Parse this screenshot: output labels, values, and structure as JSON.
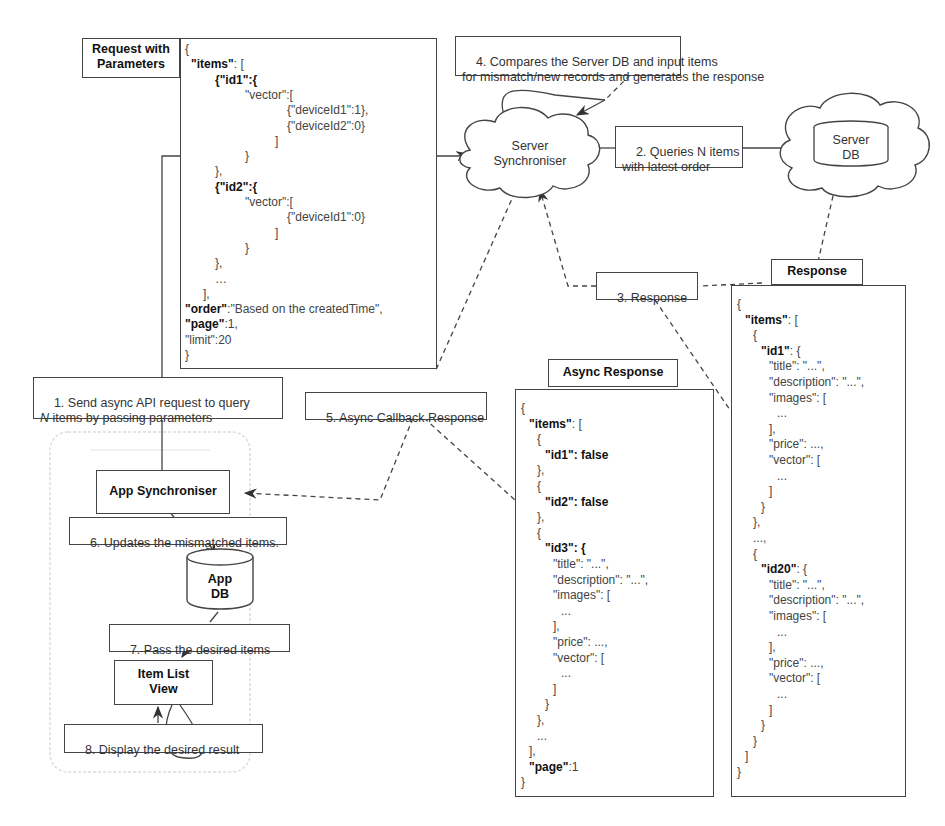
{
  "title_boxes": {
    "request": "Request with\nParameters",
    "response": "Response",
    "async_response": "Async Response"
  },
  "nodes": {
    "server_synchroniser": "Server\nSynchroniser",
    "server_db": "Server\nDB",
    "app_synchroniser": "App Synchroniser",
    "app_db": "App\nDB",
    "item_list_view": "Item List\nView"
  },
  "steps": {
    "s1": "1. Send async API request to query\nN items by passing parameters",
    "s2": "2. Queries N items\nwith latest order",
    "s3": "3. Response",
    "s4": "4. Compares the Server DB and input items\nfor mismatch/new records and generates the response",
    "s5": "5. Async Callback Response",
    "s6": "6. Updates the mismatched items.",
    "s7": "7. Pass the desired items",
    "s8": "8. Display the desired result"
  },
  "request_json": [
    {
      "indent": 0,
      "text": "{"
    },
    {
      "indent": 1,
      "key": "\"items\"",
      "text": ": ["
    },
    {
      "indent": 5,
      "key": "{\"id1\":{",
      "text": ""
    },
    {
      "indent": 10,
      "text": "\"vector\":["
    },
    {
      "indent": 17,
      "text": "{\"deviceId1\":1},"
    },
    {
      "indent": 17,
      "text": "{\"deviceId2\":0}"
    },
    {
      "indent": 15,
      "text": "]"
    },
    {
      "indent": 10,
      "text": "}"
    },
    {
      "indent": 5,
      "text": "},"
    },
    {
      "indent": 5,
      "key": "{\"id2\":{",
      "text": ""
    },
    {
      "indent": 10,
      "text": "\"vector\":["
    },
    {
      "indent": 17,
      "text": "{\"deviceId1\":0}"
    },
    {
      "indent": 15,
      "text": "]"
    },
    {
      "indent": 10,
      "text": "}"
    },
    {
      "indent": 5,
      "text": "},"
    },
    {
      "indent": 5,
      "text": "…"
    },
    {
      "indent": 3,
      "text": "],"
    },
    {
      "indent": 0,
      "key": "\"order\"",
      "text": ":\"Based on the createdTime\","
    },
    {
      "indent": 0,
      "key": "\"page\"",
      "text": ":1,"
    },
    {
      "indent": 0,
      "text": "\"limit\":20"
    },
    {
      "indent": 0,
      "text": "}"
    }
  ],
  "async_response_json": [
    {
      "indent": 0,
      "text": "{"
    },
    {
      "indent": 1,
      "key": "\"items\"",
      "text": ": ["
    },
    {
      "indent": 2,
      "text": "{"
    },
    {
      "indent": 3,
      "key": "\"id1\": false",
      "text": ""
    },
    {
      "indent": 2,
      "text": "},"
    },
    {
      "indent": 2,
      "text": "{"
    },
    {
      "indent": 3,
      "key": "\"id2\": false",
      "text": ""
    },
    {
      "indent": 2,
      "text": "},"
    },
    {
      "indent": 2,
      "text": "{"
    },
    {
      "indent": 3,
      "key": "\"id3\": {",
      "text": ""
    },
    {
      "indent": 4,
      "text": "\"title\": \"...\","
    },
    {
      "indent": 4,
      "text": "\"description\": \"...\","
    },
    {
      "indent": 4,
      "text": "\"images\": ["
    },
    {
      "indent": 5,
      "text": "..."
    },
    {
      "indent": 4,
      "text": "],"
    },
    {
      "indent": 4,
      "text": "\"price\": ...,"
    },
    {
      "indent": 4,
      "text": "\"vector\": ["
    },
    {
      "indent": 5,
      "text": "..."
    },
    {
      "indent": 4,
      "text": "]"
    },
    {
      "indent": 3,
      "text": "}"
    },
    {
      "indent": 2,
      "text": "},"
    },
    {
      "indent": 2,
      "text": "..."
    },
    {
      "indent": 1,
      "text": "],"
    },
    {
      "indent": 1,
      "key": "\"page\"",
      "text": ":1"
    },
    {
      "indent": 0,
      "text": "}"
    }
  ],
  "response_json": [
    {
      "indent": 0,
      "text": "{"
    },
    {
      "indent": 1,
      "key": "\"items\"",
      "text": ": ["
    },
    {
      "indent": 2,
      "text": "{"
    },
    {
      "indent": 3,
      "key": "\"id1\"",
      "text": ": {"
    },
    {
      "indent": 4,
      "text": "\"title\": \"...\","
    },
    {
      "indent": 4,
      "text": "\"description\": \"...\","
    },
    {
      "indent": 4,
      "text": "\"images\": ["
    },
    {
      "indent": 5,
      "text": "..."
    },
    {
      "indent": 4,
      "text": "],"
    },
    {
      "indent": 4,
      "text": "\"price\": ...,"
    },
    {
      "indent": 4,
      "text": "\"vector\": ["
    },
    {
      "indent": 5,
      "text": "..."
    },
    {
      "indent": 4,
      "text": "]"
    },
    {
      "indent": 3,
      "text": "}"
    },
    {
      "indent": 2,
      "text": "},"
    },
    {
      "indent": 2,
      "text": "...,"
    },
    {
      "indent": 2,
      "text": "{"
    },
    {
      "indent": 3,
      "key": "\"id20\"",
      "text": ": {"
    },
    {
      "indent": 4,
      "text": "\"title\": \"...\","
    },
    {
      "indent": 4,
      "text": "\"description\": \"...\","
    },
    {
      "indent": 4,
      "text": "\"images\": ["
    },
    {
      "indent": 5,
      "text": "..."
    },
    {
      "indent": 4,
      "text": "],"
    },
    {
      "indent": 4,
      "text": "\"price\": ...,"
    },
    {
      "indent": 4,
      "text": "\"vector\": ["
    },
    {
      "indent": 5,
      "text": "..."
    },
    {
      "indent": 4,
      "text": "]"
    },
    {
      "indent": 3,
      "text": "}"
    },
    {
      "indent": 2,
      "text": "}"
    },
    {
      "indent": 1,
      "text": "]"
    },
    {
      "indent": 0,
      "text": "}"
    }
  ],
  "colors": {
    "line": "#444444",
    "text": "#333333",
    "phone_outline": "#d8d8d8"
  }
}
